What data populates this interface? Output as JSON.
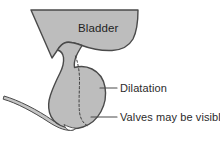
{
  "figure": {
    "background_color": "#ffffff",
    "organ_fill_color": "#bdbdbd",
    "organ_outline_color": "#4a4a4a",
    "tube_fill_color": "#c4c4c4",
    "dashed_line_color": "#3d3d3d",
    "leader_line_color": "#4a4a4a",
    "label_text_color": "#2b2b2b"
  },
  "labels": {
    "bladder": "Bladder",
    "dilatation": "Dilatation",
    "valves": "Valves may be visible"
  },
  "structures": {
    "bladder_name": "bladder",
    "dilated_urethra_name": "dilatation",
    "valve_region_name": "valves",
    "catheter_name": "tube"
  }
}
